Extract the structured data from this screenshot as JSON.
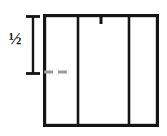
{
  "figure": {
    "type": "technical-line-drawing",
    "title": "",
    "background_color": "#ffffff",
    "width": 167,
    "height": 136,
    "stroke_color": "#141414",
    "accent_gray": "#9a9a9a"
  },
  "labels": {
    "dimension_fraction": "½"
  },
  "dimension": {
    "name": "half-height-dimension",
    "label": "½",
    "orientation": "vertical",
    "line_x": 33,
    "top_y": 16,
    "bottom_y": 74,
    "serif_half_width": 7,
    "stroke_width": 2.4,
    "color": "#141414"
  },
  "outer_rect": {
    "name": "outer-rectangle",
    "x": 43,
    "y": 14,
    "width": 116,
    "height": 113,
    "stroke_width": 3.2,
    "color": "#141414"
  },
  "inner_lines": [
    {
      "name": "divider-left",
      "x": 78,
      "y1": 16,
      "y2": 126,
      "full_height": true,
      "stroke_width": 2.6,
      "color": "#141414"
    },
    {
      "name": "divider-top-stub",
      "x": 101,
      "y1": 15,
      "y2": 24,
      "full_height": false,
      "stroke_width": 3.0,
      "color": "#141414"
    },
    {
      "name": "divider-right",
      "x": 129,
      "y1": 16,
      "y2": 126,
      "full_height": true,
      "stroke_width": 2.6,
      "color": "#141414"
    }
  ],
  "dashed_reference": {
    "name": "gray-dashed-reference-line",
    "y": 72,
    "x1": 44,
    "x2": 70,
    "stroke_width": 3.2,
    "color": "#9a9a9a",
    "dash_pattern": "9 5"
  }
}
